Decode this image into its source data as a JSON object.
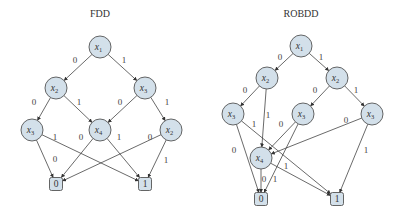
{
  "diagrams": [
    {
      "id": "fdd",
      "title": "FDD",
      "title_pos": [
        100,
        17
      ],
      "nodes": [
        {
          "id": "a_x1",
          "var": "x",
          "sub": "1",
          "cx": 100,
          "cy": 47
        },
        {
          "id": "a_x2",
          "var": "x",
          "sub": "2",
          "cx": 56,
          "cy": 88
        },
        {
          "id": "a_x3",
          "var": "x",
          "sub": "3",
          "cx": 145,
          "cy": 88
        },
        {
          "id": "a_x3b",
          "var": "x",
          "sub": "3",
          "cx": 32,
          "cy": 130
        },
        {
          "id": "a_x4",
          "var": "x",
          "sub": "4",
          "cx": 100,
          "cy": 130
        },
        {
          "id": "a_x2b",
          "var": "x",
          "sub": "2",
          "cx": 171,
          "cy": 130
        }
      ],
      "terminals": [
        {
          "id": "a_t0",
          "label": "0",
          "cx": 56,
          "cy": 184
        },
        {
          "id": "a_t1",
          "label": "1",
          "cx": 145,
          "cy": 184
        }
      ],
      "edges": [
        {
          "from": "a_x1",
          "to": "a_x2",
          "label": "0",
          "lx": 75,
          "ly": 63
        },
        {
          "from": "a_x1",
          "to": "a_x3",
          "label": "1",
          "lx": 124,
          "ly": 63
        },
        {
          "from": "a_x2",
          "to": "a_x3b",
          "label": "0",
          "lx": 34,
          "ly": 105
        },
        {
          "from": "a_x2",
          "to": "a_x4",
          "label": "1",
          "lx": 79,
          "ly": 105
        },
        {
          "from": "a_x3",
          "to": "a_x4",
          "label": "0",
          "lx": 120,
          "ly": 105
        },
        {
          "from": "a_x3",
          "to": "a_x2b",
          "label": "1",
          "lx": 167,
          "ly": 105
        },
        {
          "from": "a_x3b",
          "to": "a_t0",
          "label": "0",
          "lx": 55,
          "ly": 162
        },
        {
          "from": "a_x3b",
          "to": "a_t1",
          "label": "1",
          "lx": 55,
          "ly": 140
        },
        {
          "from": "a_x4",
          "to": "a_t0",
          "label": "0",
          "lx": 81,
          "ly": 140
        },
        {
          "from": "a_x4",
          "to": "a_t1",
          "label": "1",
          "lx": 119,
          "ly": 140
        },
        {
          "from": "a_x2b",
          "to": "a_t0",
          "label": "0",
          "lx": 150,
          "ly": 140
        },
        {
          "from": "a_x2b",
          "to": "a_t1",
          "label": "1",
          "lx": 166,
          "ly": 163
        }
      ]
    },
    {
      "id": "robdd",
      "title": "ROBDD",
      "title_pos": [
        301,
        17
      ],
      "nodes": [
        {
          "id": "b_x1",
          "var": "x",
          "sub": "1",
          "cx": 301,
          "cy": 46
        },
        {
          "id": "b_x2",
          "var": "x",
          "sub": "2",
          "cx": 267,
          "cy": 78
        },
        {
          "id": "b_x2b",
          "var": "x",
          "sub": "2",
          "cx": 337,
          "cy": 78
        },
        {
          "id": "b_x3",
          "var": "x",
          "sub": "3",
          "cx": 233,
          "cy": 114
        },
        {
          "id": "b_x3b",
          "var": "x",
          "sub": "3",
          "cx": 303,
          "cy": 114
        },
        {
          "id": "b_x3c",
          "var": "x",
          "sub": "3",
          "cx": 372,
          "cy": 114
        },
        {
          "id": "b_x4",
          "var": "x",
          "sub": "4",
          "cx": 261,
          "cy": 158
        }
      ],
      "terminals": [
        {
          "id": "b_t0",
          "label": "0",
          "cx": 261,
          "cy": 199
        },
        {
          "id": "b_t1",
          "label": "1",
          "cx": 337,
          "cy": 199
        }
      ],
      "edges": [
        {
          "from": "b_x1",
          "to": "b_x2",
          "label": "0",
          "lx": 280,
          "ly": 60
        },
        {
          "from": "b_x1",
          "to": "b_x2b",
          "label": "1",
          "lx": 321,
          "ly": 60
        },
        {
          "from": "b_x2",
          "to": "b_x3",
          "label": "0",
          "lx": 245,
          "ly": 93
        },
        {
          "from": "b_x2",
          "to": "b_x4",
          "label": "1",
          "lx": 268,
          "ly": 118
        },
        {
          "from": "b_x2b",
          "to": "b_x3b",
          "label": "0",
          "lx": 315,
          "ly": 93
        },
        {
          "from": "b_x2b",
          "to": "b_x3c",
          "label": "1",
          "lx": 356,
          "ly": 93
        },
        {
          "from": "b_x3",
          "to": "b_t0",
          "label": "0",
          "lx": 234,
          "ly": 153
        },
        {
          "from": "b_x3",
          "to": "b_t1",
          "label": "1",
          "lx": 254,
          "ly": 127,
          "via": [
            262,
            147
          ]
        },
        {
          "from": "b_x3b",
          "to": "b_x4",
          "label": "0",
          "lx": 281,
          "ly": 127
        },
        {
          "from": "b_x3b",
          "to": "b_t0",
          "label": "1",
          "lx": 275,
          "ly": 182
        },
        {
          "from": "b_x3c",
          "to": "b_x4",
          "label": "0",
          "lx": 346,
          "ly": 123
        },
        {
          "from": "b_x3c",
          "to": "b_t1",
          "label": "1",
          "lx": 366,
          "ly": 153
        },
        {
          "from": "b_x4",
          "to": "b_t0",
          "label": "0",
          "lx": 264,
          "ly": 182
        },
        {
          "from": "b_x4",
          "to": "b_t1",
          "label": "1",
          "lx": 286,
          "ly": 169
        }
      ]
    }
  ],
  "style": {
    "node_fill": "#d3e0ea",
    "node_stroke": "#555555",
    "edge_color": "#444444",
    "node_radius": 11,
    "terminal_size": 13
  }
}
